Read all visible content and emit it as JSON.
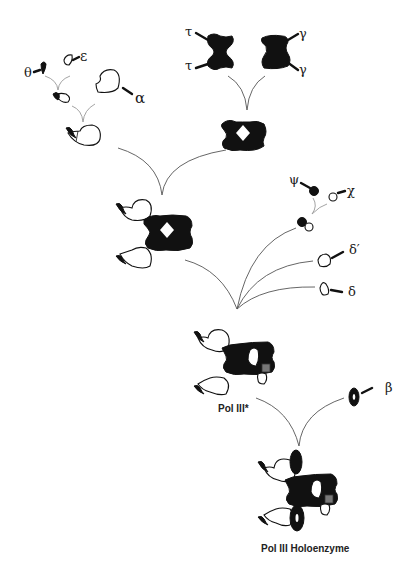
{
  "diagram": {
    "subunit_labels": {
      "theta": "θ",
      "epsilon": "ε",
      "alpha": "α",
      "tau_top": "τ",
      "tau_bottom": "τ",
      "gamma_top": "γ",
      "gamma_bottom": "γ",
      "psi": "ψ",
      "chi": "χ",
      "delta_prime": "δ′",
      "delta": "δ",
      "beta": "β"
    },
    "captions": {
      "pol3_star": "Pol III*",
      "holoenzyme": "Pol III Holoenzyme"
    },
    "colors": {
      "ink": "#111111",
      "arrow": "#555555",
      "background": "#ffffff"
    }
  }
}
